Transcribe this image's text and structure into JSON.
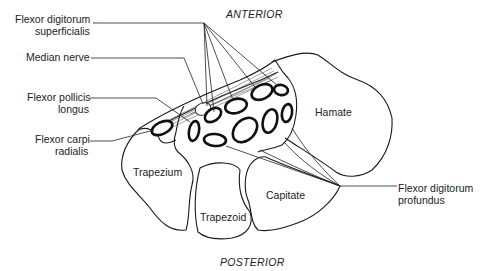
{
  "orientation": {
    "top": "ANTERIOR",
    "bottom": "POSTERIOR"
  },
  "labels": {
    "fds_line1": "Flexor digitorum",
    "fds_line2": "superficialis",
    "median_nerve": "Median nerve",
    "fpl_line1": "Flexor pollicis",
    "fpl_line2": "longus",
    "fcr_line1": "Flexor carpi",
    "fcr_line2": "radialis",
    "fdp_line1": "Flexor digitorum",
    "fdp_line2": "profundus"
  },
  "bones": {
    "hamate": "Hamate",
    "trapezium": "Trapezium",
    "trapezoid": "Trapezoid",
    "capitate": "Capitate"
  },
  "colors": {
    "ink": "#1a1a1a",
    "background": "#ffffff"
  }
}
